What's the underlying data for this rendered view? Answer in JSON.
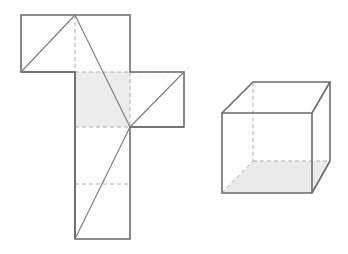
{
  "document": {
    "title": "Cube net and cube solid",
    "background_color": "#ffffff",
    "width": 348,
    "height": 254
  },
  "style": {
    "solid_stroke_color": "#6b6b6b",
    "solid_stroke_width": 1.6,
    "thin_stroke_color": "#7a7a7a",
    "thin_stroke_width": 1.1,
    "dashed_stroke_color": "#b0b0b0",
    "dashed_stroke_width": 1,
    "dash_pattern": "4,3",
    "shade_fill": "#ececec",
    "face_fill": "#ffffff",
    "shade_fill_cube": "#ebebeb"
  },
  "figures": [
    {
      "name": "cube-net",
      "label": "Net of a cube",
      "type": "net",
      "fold_line_style": "dashed",
      "shaded_faces": 1,
      "faces": [
        {
          "name": "net-face-top-left",
          "shape": "rectangle",
          "x": 21,
          "y": 15,
          "width": 54,
          "height": 57,
          "fill": "#ffffff"
        },
        {
          "name": "net-face-top-right",
          "shape": "rectangle",
          "x": 75,
          "y": 15,
          "width": 55,
          "height": 57,
          "fill": "#ffffff"
        },
        {
          "name": "net-face-center-shaded",
          "shape": "rectangle",
          "x": 75,
          "y": 72,
          "width": 55,
          "height": 55,
          "fill": "#ececec"
        },
        {
          "name": "net-face-right-flap",
          "shape": "rectangle",
          "x": 130,
          "y": 72,
          "width": 54,
          "height": 55,
          "fill": "#ffffff"
        },
        {
          "name": "net-face-lower-upper",
          "shape": "rectangle",
          "x": 75,
          "y": 127,
          "width": 55,
          "height": 57,
          "fill": "#ffffff"
        },
        {
          "name": "net-face-lower-bottom",
          "shape": "rectangle",
          "x": 75,
          "y": 184,
          "width": 55,
          "height": 55,
          "fill": "#ffffff"
        }
      ],
      "outline_points": "21,15 130,15 130,72 184,72 184,127 130,127 130,239 75,239 75,127 21,127 21,72 21,15",
      "outline_points_corrected": "21,15 130,15 130,72 184,72 184,127 130,127 130,239 75,239 75,127 75,72 21,72 21,15",
      "fold_lines": [
        {
          "name": "fold-vertical-top",
          "x1": 75,
          "y1": 15,
          "x2": 75,
          "y2": 72
        },
        {
          "name": "fold-horizontal-upper",
          "x1": 75,
          "y1": 72,
          "x2": 184,
          "y2": 72
        },
        {
          "name": "fold-vertical-center",
          "x1": 130,
          "y1": 72,
          "x2": 130,
          "y2": 127
        },
        {
          "name": "fold-horizontal-middle",
          "x1": 75,
          "y1": 127,
          "x2": 130,
          "y2": 127
        },
        {
          "name": "fold-horizontal-lower",
          "x1": 75,
          "y1": 184,
          "x2": 130,
          "y2": 184
        }
      ],
      "diagonals": [
        {
          "name": "diagonal-top-left-face",
          "x1": 75,
          "y1": 15,
          "x2": 21,
          "y2": 72
        },
        {
          "name": "diagonal-long-center",
          "x1": 75,
          "y1": 15,
          "x2": 130,
          "y2": 127
        },
        {
          "name": "diagonal-right-flap",
          "x1": 130,
          "y1": 127,
          "x2": 184,
          "y2": 72
        },
        {
          "name": "diagonal-lower-column",
          "x1": 130,
          "y1": 127,
          "x2": 75,
          "y2": 239
        }
      ],
      "junction_point": {
        "name": "net-junction-vertex",
        "x": 130,
        "y": 127,
        "incident_lines": 3
      }
    },
    {
      "name": "cube-solid",
      "label": "Cube drawn in oblique projection",
      "type": "solid",
      "hidden_edge_style": "dashed",
      "shaded_faces": 1,
      "vertices": {
        "front_top_left": {
          "x": 222,
          "y": 113
        },
        "front_top_right": {
          "x": 312,
          "y": 113
        },
        "front_bottom_right": {
          "x": 312,
          "y": 193
        },
        "front_bottom_left": {
          "x": 222,
          "y": 193
        },
        "back_top_left": {
          "x": 253,
          "y": 82
        },
        "back_top_right": {
          "x": 330,
          "y": 82
        },
        "back_bottom_right": {
          "x": 330,
          "y": 161
        },
        "back_bottom_left": {
          "x": 253,
          "y": 161
        }
      },
      "faces": [
        {
          "name": "cube-face-bottom",
          "points": "222,193 312,193 330,161 253,161",
          "fill": "#ebebeb"
        },
        {
          "name": "cube-face-front",
          "points": "222,113 312,113 312,193 222,193",
          "fill": "none"
        },
        {
          "name": "cube-face-top",
          "points": "222,113 253,82 330,82 312,113",
          "fill": "none"
        },
        {
          "name": "cube-face-right",
          "points": "312,113 330,82 330,161 312,193",
          "fill": "none"
        }
      ],
      "visible_edges": [
        {
          "name": "edge-front-top",
          "x1": 222,
          "y1": 113,
          "x2": 312,
          "y2": 113
        },
        {
          "name": "edge-front-right",
          "x1": 312,
          "y1": 113,
          "x2": 312,
          "y2": 193
        },
        {
          "name": "edge-front-bottom",
          "x1": 312,
          "y1": 193,
          "x2": 222,
          "y2": 193
        },
        {
          "name": "edge-front-left",
          "x1": 222,
          "y1": 193,
          "x2": 222,
          "y2": 113
        },
        {
          "name": "edge-top-left-receding",
          "x1": 222,
          "y1": 113,
          "x2": 253,
          "y2": 82
        },
        {
          "name": "edge-top-right-receding",
          "x1": 312,
          "y1": 113,
          "x2": 330,
          "y2": 82
        },
        {
          "name": "edge-back-top",
          "x1": 253,
          "y1": 82,
          "x2": 330,
          "y2": 82
        },
        {
          "name": "edge-back-right",
          "x1": 330,
          "y1": 82,
          "x2": 330,
          "y2": 161
        },
        {
          "name": "edge-bottom-right-receding",
          "x1": 312,
          "y1": 193,
          "x2": 330,
          "y2": 161
        }
      ],
      "hidden_edges": [
        {
          "name": "edge-back-left-vertical",
          "x1": 253,
          "y1": 82,
          "x2": 253,
          "y2": 161
        },
        {
          "name": "edge-back-bottom",
          "x1": 253,
          "y1": 161,
          "x2": 330,
          "y2": 161
        },
        {
          "name": "edge-bottom-left-receding",
          "x1": 222,
          "y1": 193,
          "x2": 253,
          "y2": 161
        }
      ]
    }
  ]
}
